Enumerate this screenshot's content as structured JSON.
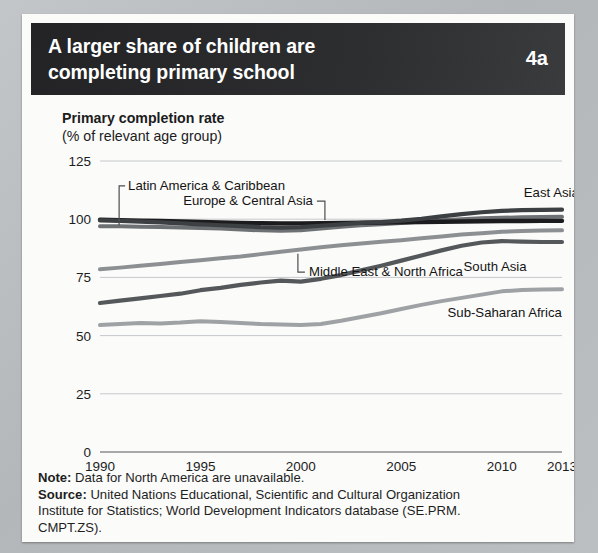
{
  "figure": {
    "number": "4a",
    "title_lines": [
      "A larger share of children are",
      "completing primary school"
    ],
    "caption_bold": "Primary completion rate",
    "caption_sub": "(% of relevant age group)"
  },
  "footnote": {
    "note_label": "Note:",
    "note_text": " Data for North America are unavailable.",
    "source_label": "Source:",
    "source_text": " United Nations Educational, Scientific and Cultural Organization",
    "source_line2": "Institute for Statistics; World Development Indicators database (SE.PRM.",
    "source_line3": "CMPT.ZS)."
  },
  "chart_data": {
    "type": "line",
    "title": "A larger share of children are completing primary school",
    "xlabel": "",
    "ylabel": "Primary completion rate (% of relevant age group)",
    "xlim": [
      1990,
      2013
    ],
    "ylim": [
      0,
      125
    ],
    "yticks": [
      0,
      25,
      50,
      75,
      100,
      125
    ],
    "xticks": [
      1990,
      1995,
      2000,
      2005,
      2010,
      2013
    ],
    "grid": "horizontal",
    "legend": "inline-labels",
    "x": [
      1990,
      1991,
      1992,
      1993,
      1994,
      1995,
      1996,
      1997,
      1998,
      1999,
      2000,
      2001,
      2002,
      2003,
      2004,
      2005,
      2006,
      2007,
      2008,
      2009,
      2010,
      2011,
      2012,
      2013
    ],
    "series": [
      {
        "name": "Latin America & Caribbean",
        "color": "#6e7174",
        "width": 4.0,
        "label_x": 1991.4,
        "label_y": 114.5,
        "leader": "elbow-down-left",
        "values": [
          97.0,
          97.0,
          96.8,
          96.6,
          96.4,
          96.2,
          96.0,
          95.6,
          95.2,
          95.0,
          95.2,
          96.0,
          96.8,
          97.4,
          97.8,
          98.4,
          99.0,
          99.6,
          100.0,
          100.4,
          100.6,
          100.8,
          100.9,
          101.0
        ]
      },
      {
        "name": "Europe & Central Asia",
        "color": "#1c1c1e",
        "width": 4.4,
        "label_x": 2000.6,
        "label_y": 108.0,
        "leader": "elbow-down-right",
        "values": [
          99.8,
          99.6,
          99.4,
          99.2,
          99.0,
          98.8,
          98.6,
          98.4,
          98.3,
          98.2,
          98.2,
          98.3,
          98.4,
          98.5,
          98.6,
          98.7,
          98.8,
          98.9,
          99.0,
          99.1,
          99.2,
          99.2,
          99.3,
          99.3
        ]
      },
      {
        "name": "East Asia & Pacific",
        "color": "#3d4043",
        "width": 4.2,
        "label_x": 2011.1,
        "label_y": 111.5,
        "leader": "none",
        "values": [
          99.5,
          99.3,
          99.0,
          98.6,
          98.2,
          97.8,
          97.4,
          97.0,
          96.6,
          96.4,
          96.6,
          97.2,
          97.8,
          98.4,
          98.8,
          99.4,
          100.2,
          101.2,
          102.2,
          103.0,
          103.6,
          103.9,
          104.0,
          104.1
        ]
      },
      {
        "name": "Middle East & North Africa",
        "color": "#8d9093",
        "width": 4.0,
        "label_x": 2000.4,
        "label_y": 77.5,
        "leader": "elbow-up-left",
        "values": [
          78.5,
          79.2,
          80.0,
          80.8,
          81.6,
          82.4,
          83.2,
          84.0,
          85.0,
          86.0,
          87.0,
          88.0,
          88.8,
          89.6,
          90.3,
          91.0,
          91.8,
          92.6,
          93.4,
          94.0,
          94.6,
          94.9,
          95.1,
          95.2
        ]
      },
      {
        "name": "South Asia",
        "color": "#55585b",
        "width": 4.2,
        "label_x": 2008.1,
        "label_y": 79.5,
        "leader": "none",
        "values": [
          64.0,
          65.0,
          66.0,
          67.0,
          68.0,
          69.5,
          70.5,
          71.8,
          72.8,
          73.6,
          73.2,
          74.4,
          76.0,
          78.0,
          80.0,
          82.2,
          84.4,
          86.6,
          88.6,
          90.0,
          90.6,
          90.4,
          90.2,
          90.2
        ]
      },
      {
        "name": "Sub-Saharan Africa",
        "color": "#9fa2a5",
        "width": 4.0,
        "label_x": 2007.3,
        "label_y": 60.0,
        "leader": "none",
        "values": [
          54.5,
          55.0,
          55.4,
          55.2,
          55.6,
          56.2,
          55.8,
          55.4,
          55.0,
          54.8,
          54.6,
          55.0,
          56.4,
          58.0,
          59.6,
          61.4,
          63.2,
          64.8,
          66.2,
          67.6,
          69.0,
          69.6,
          69.8,
          69.9
        ]
      }
    ]
  }
}
